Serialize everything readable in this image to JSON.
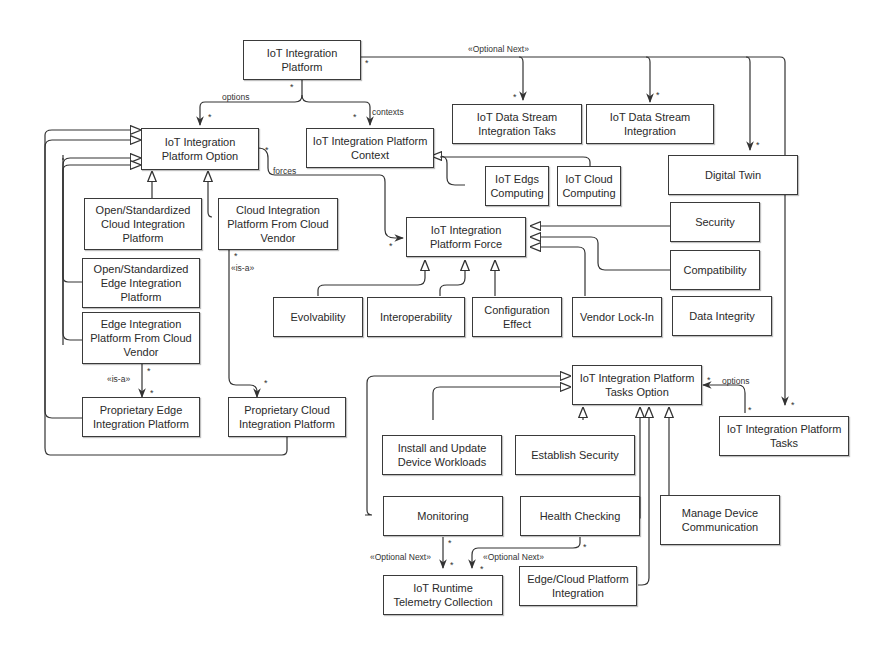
{
  "diagram": {
    "boxes": {
      "platform": "IoT Integration Platform",
      "option": "IoT Integration Platform Option",
      "context": "IoT Integration Platform Context",
      "ds_tasks": "IoT Data Stream Integration Taks",
      "ds_integration": "IoT Data Stream Integration",
      "edge_computing": "IoT Edgs Computing",
      "cloud_computing": "IoT Cloud Computing",
      "digital_twin": "Digital Twin",
      "open_cloud": "Open/Standardized Cloud Integration Platform",
      "cloud_vendor": "Cloud Integration Platform From Cloud Vendor",
      "open_edge": "Open/Standardized Edge Integration Platform",
      "edge_vendor": "Edge Integration Platform From Cloud Vendor",
      "prop_edge": "Proprietary Edge Integration Platform",
      "prop_cloud": "Proprietary Cloud Integration Platform",
      "force": "IoT Integration Platform Force",
      "security": "Security",
      "compatibility": "Compatibility",
      "evolvability": "Evolvability",
      "interoperability": "Interoperability",
      "config_effect": "Configuration Effect",
      "vendor_lockin": "Vendor Lock-In",
      "data_integrity": "Data Integrity",
      "tasks_option": "IoT Integration Platform Tasks Option",
      "tasks": "IoT Integration Platform Tasks",
      "install_update": "Install and Update Device Workloads",
      "establish_security": "Establish Security",
      "monitoring": "Monitoring",
      "health_checking": "Health Checking",
      "manage_comm": "Manage Device Communication",
      "telemetry": "IoT Runtime Telemetry Collection",
      "edge_cloud_integration": "Edge/Cloud Platform Integration"
    },
    "labels": {
      "optional_next_top": "«Optional Next»",
      "options": "options",
      "contexts": "contexts",
      "forces": "forces",
      "is_a_cloud": "«is-a»",
      "is_a_edge": "«is-a»",
      "options_tasks": "options",
      "optional_next_monitoring": "«Optional Next»",
      "optional_next_health": "«Optional Next»",
      "multiplicity": "*"
    }
  }
}
